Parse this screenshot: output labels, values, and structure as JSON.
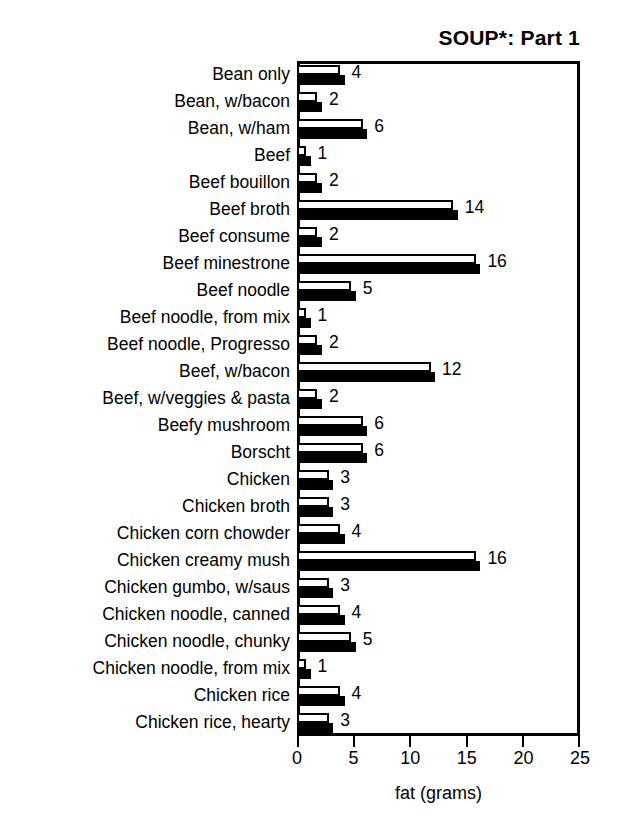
{
  "chart_data": {
    "type": "bar",
    "title": "SOUP*: Part 1",
    "xlabel": "fat (grams)",
    "ylabel": "",
    "orientation": "horizontal",
    "xlim": [
      0,
      25
    ],
    "xticks": [
      0,
      5,
      10,
      15,
      20,
      25
    ],
    "xtick_labels": [
      "0",
      "5",
      "10",
      "15",
      "20",
      "25"
    ],
    "grid": false,
    "legend": null,
    "bar_style": "paired open-and-filled bars per category (drop-shadow style); value label equals the category fat content in grams",
    "categories": [
      "Bean only",
      "Bean, w/bacon",
      "Bean, w/ham",
      "Beef",
      "Beef bouillon",
      "Beef broth",
      "Beef consume",
      "Beef minestrone",
      "Beef noodle",
      "Beef noodle, from mix",
      "Beef noodle, Progresso",
      "Beef, w/bacon",
      "Beef, w/veggies & pasta",
      "Beefy mushroom",
      "Borscht",
      "Chicken",
      "Chicken broth",
      "Chicken corn chowder",
      "Chicken creamy mush",
      "Chicken gumbo, w/saus",
      "Chicken noodle, canned",
      "Chicken noodle, chunky",
      "Chicken noodle, from mix",
      "Chicken rice",
      "Chicken rice, hearty"
    ],
    "values": [
      4,
      2,
      6,
      1,
      2,
      14,
      2,
      16,
      5,
      1,
      2,
      12,
      2,
      6,
      6,
      3,
      3,
      4,
      16,
      3,
      4,
      5,
      1,
      4,
      3
    ],
    "value_labels": [
      "4",
      "2",
      "6",
      "1",
      "2",
      "14",
      "2",
      "16",
      "5",
      "1",
      "2",
      "12",
      "2",
      "6",
      "6",
      "3",
      "3",
      "4",
      "16",
      "3",
      "4",
      "5",
      "1",
      "4",
      "3"
    ],
    "series": [
      {
        "name": "open bar",
        "style": "white fill, black outline",
        "values": [
          3.8,
          1.8,
          5.8,
          0.8,
          1.8,
          13.8,
          1.8,
          15.8,
          4.8,
          0.8,
          1.8,
          11.8,
          1.8,
          5.8,
          5.8,
          2.8,
          2.8,
          3.8,
          15.8,
          2.8,
          3.8,
          4.8,
          0.8,
          3.8,
          2.8
        ]
      },
      {
        "name": "filled bar",
        "style": "solid black",
        "values": [
          4.2,
          2.2,
          6.2,
          1.2,
          2.2,
          14.2,
          2.2,
          16.2,
          5.2,
          1.2,
          2.2,
          12.2,
          2.2,
          6.2,
          6.2,
          3.2,
          3.2,
          4.2,
          16.2,
          3.2,
          4.2,
          5.2,
          1.2,
          4.2,
          3.2
        ]
      }
    ],
    "colors": {
      "open_fill": "#ffffff",
      "outline": "#000000",
      "filled": "#000000",
      "background": "#ffffff",
      "text": "#000000"
    }
  }
}
